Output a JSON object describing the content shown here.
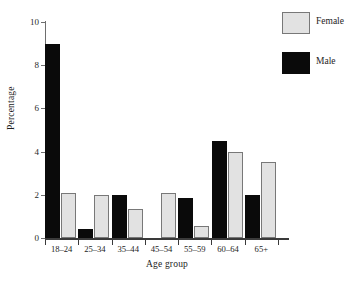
{
  "chart_data": {
    "type": "bar",
    "title": "",
    "xlabel": "Age group",
    "ylabel": "Percentage",
    "categories": [
      "18–24",
      "25–34",
      "35–44",
      "45–54",
      "55–59",
      "60–64",
      "65+"
    ],
    "series": [
      {
        "name": "Male",
        "color": "#0a0a0a",
        "values": [
          9.0,
          0.4,
          2.0,
          0.0,
          1.85,
          4.5,
          2.0
        ]
      },
      {
        "name": "Female",
        "color": "#e2e2e2",
        "values": [
          2.1,
          2.0,
          1.35,
          2.1,
          0.55,
          4.0,
          3.5
        ]
      }
    ],
    "ylim": [
      0,
      10
    ],
    "yticks": [
      "0",
      "2",
      "4",
      "6",
      "8",
      "10"
    ],
    "ytick_values": [
      0,
      2,
      4,
      6,
      8,
      10
    ],
    "grid": false,
    "legend_position": "top-right",
    "legend_entries": [
      {
        "label": "Female",
        "swatch": "light-gray-filled-square"
      },
      {
        "label": "Male",
        "swatch": "black-filled-square"
      }
    ]
  }
}
